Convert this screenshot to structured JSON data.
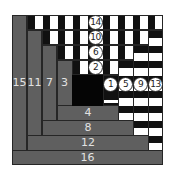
{
  "diagram": {
    "type": "log-cabin-quilt-block",
    "colors": {
      "gray": "#5f5f5f",
      "black": "#111111",
      "white": "#ffffff",
      "label": "#e2e2e2",
      "border": "#262626"
    },
    "pieces": [
      {
        "n": "1",
        "style": "striped-horizontal"
      },
      {
        "n": "2",
        "style": "striped-vertical"
      },
      {
        "n": "3",
        "style": "gray"
      },
      {
        "n": "4",
        "style": "gray"
      },
      {
        "n": "5",
        "style": "striped-horizontal"
      },
      {
        "n": "6",
        "style": "striped-vertical"
      },
      {
        "n": "7",
        "style": "gray"
      },
      {
        "n": "8",
        "style": "gray"
      },
      {
        "n": "9",
        "style": "striped-horizontal"
      },
      {
        "n": "10",
        "style": "striped-vertical"
      },
      {
        "n": "11",
        "style": "gray"
      },
      {
        "n": "12",
        "style": "gray"
      },
      {
        "n": "13",
        "style": "striped-horizontal"
      },
      {
        "n": "14",
        "style": "striped-vertical"
      },
      {
        "n": "15",
        "style": "gray"
      },
      {
        "n": "16",
        "style": "gray"
      }
    ],
    "labels": {
      "p1": "1",
      "p2": "2",
      "p3": "3",
      "p4": "4",
      "p5": "5",
      "p6": "6",
      "p7": "7",
      "p8": "8",
      "p9": "9",
      "p10": "10",
      "p11": "11",
      "p12": "12",
      "p13": "13",
      "p14": "14",
      "p15": "15",
      "p16": "16"
    }
  }
}
